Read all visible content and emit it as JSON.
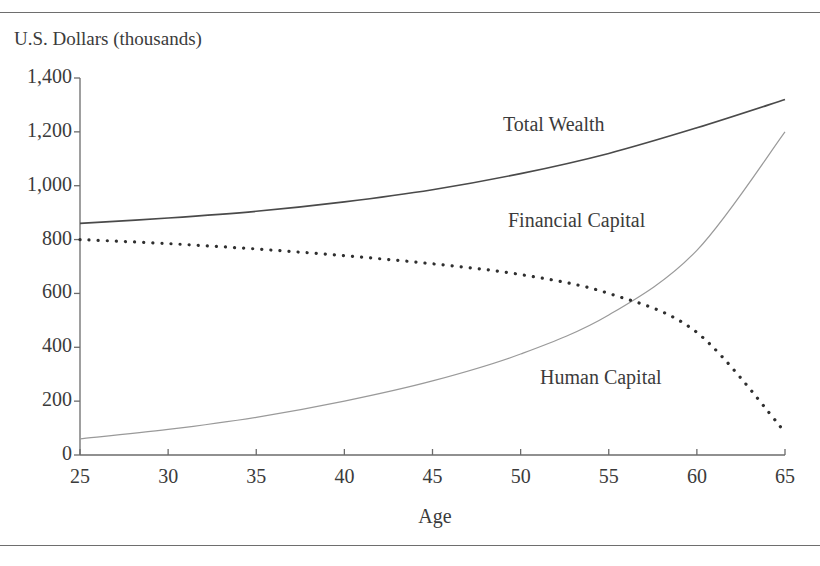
{
  "figure": {
    "top_rule": "horizontal-rule",
    "bottom_rule": "horizontal-rule"
  },
  "chart_data": {
    "type": "line",
    "title": "",
    "xlabel": "Age",
    "ylabel": "U.S. Dollars (thousands)",
    "xlim": [
      25,
      65
    ],
    "ylim": [
      0,
      1400
    ],
    "xticks": [
      25,
      30,
      35,
      40,
      45,
      50,
      55,
      60,
      65
    ],
    "xtick_labels": [
      "25",
      "30",
      "35",
      "40",
      "45",
      "50",
      "55",
      "60",
      "65"
    ],
    "yticks": [
      0,
      200,
      400,
      600,
      800,
      1000,
      1200,
      1400
    ],
    "ytick_labels": [
      "0",
      "200",
      "400",
      "600",
      "800",
      "1,000",
      "1,200",
      "1,400"
    ],
    "grid": false,
    "legend": "inline-annotations",
    "x": [
      25,
      30,
      35,
      40,
      45,
      50,
      55,
      60,
      65
    ],
    "series": [
      {
        "name": "Total Wealth",
        "style": "solid",
        "color": "#4a4a4a",
        "width": 1.6,
        "label_x": 52.5,
        "label_y": 1175,
        "values": [
          860,
          880,
          905,
          940,
          985,
          1045,
          1120,
          1215,
          1320
        ]
      },
      {
        "name": "Financial Capital",
        "style": "solid",
        "color": "#9a9a9a",
        "width": 1.2,
        "label_x": 53.0,
        "label_y": 880,
        "values": [
          60,
          95,
          140,
          200,
          275,
          375,
          520,
          760,
          1200
        ]
      },
      {
        "name": "Human Capital",
        "style": "dotted",
        "color": "#2f2f2f",
        "width": 3.2,
        "label_x": 56.5,
        "label_y": 300,
        "values": [
          800,
          785,
          765,
          740,
          710,
          670,
          600,
          455,
          85
        ]
      }
    ],
    "annotations": [
      {
        "text": "Total Wealth",
        "series": "Total Wealth"
      },
      {
        "text": "Financial Capital",
        "series": "Financial Capital"
      },
      {
        "text": "Human Capital",
        "series": "Human Capital"
      }
    ],
    "axis_color": "#6b6b6b",
    "plot_area": {
      "left": 80,
      "right": 785,
      "top": 78,
      "bottom": 455
    }
  }
}
